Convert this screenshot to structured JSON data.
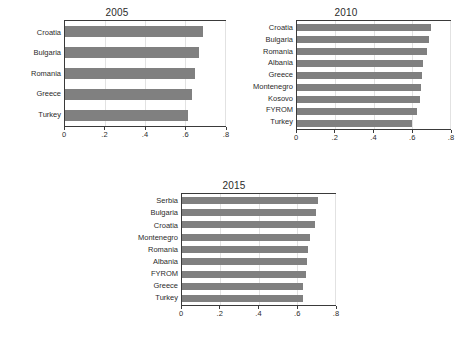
{
  "figure": {
    "background_color": "#ffffff",
    "bar_color": "#808080",
    "frame_color": "#3a3a3a",
    "gridline_color": "#e2e2e2"
  },
  "panels": [
    {
      "id": "panel-2005",
      "title": "2005"
    },
    {
      "id": "panel-2010",
      "title": "2010"
    },
    {
      "id": "panel-2015",
      "title": "2015"
    }
  ],
  "chart_data": [
    {
      "type": "bar",
      "orientation": "horizontal",
      "title": "2005",
      "xlabel": "",
      "ylabel": "",
      "xlim": [
        0,
        0.8
      ],
      "xticks": [
        0,
        0.2,
        0.4,
        0.6,
        0.8
      ],
      "xticklabels": [
        "0",
        ".2",
        ".4",
        ".6",
        ".8"
      ],
      "grid": true,
      "legend": "none",
      "categories": [
        "Croatia",
        "Bulgaria",
        "Romania",
        "Greece",
        "Turkey"
      ],
      "values": [
        0.69,
        0.67,
        0.65,
        0.635,
        0.615
      ]
    },
    {
      "type": "bar",
      "orientation": "horizontal",
      "title": "2010",
      "xlabel": "",
      "ylabel": "",
      "xlim": [
        0,
        0.8
      ],
      "xticks": [
        0,
        0.2,
        0.4,
        0.6,
        0.8
      ],
      "xticklabels": [
        "0",
        ".2",
        ".4",
        ".6",
        ".8"
      ],
      "grid": true,
      "legend": "none",
      "categories": [
        "Croatia",
        "Bulgaria",
        "Romania",
        "Albania",
        "Greece",
        "Montenegro",
        "Kosovo",
        "FYROM",
        "Turkey"
      ],
      "values": [
        0.7,
        0.69,
        0.68,
        0.66,
        0.655,
        0.65,
        0.645,
        0.625,
        0.6
      ]
    },
    {
      "type": "bar",
      "orientation": "horizontal",
      "title": "2015",
      "xlabel": "",
      "ylabel": "",
      "xlim": [
        0,
        0.8
      ],
      "xticks": [
        0,
        0.2,
        0.4,
        0.6,
        0.8
      ],
      "xticklabels": [
        "0",
        ".2",
        ".4",
        ".6",
        ".8"
      ],
      "grid": true,
      "legend": "none",
      "categories": [
        "Serbia",
        "Bulgaria",
        "Croatia",
        "Montenegro",
        "Romania",
        "Albania",
        "FYROM",
        "Greece",
        "Turkey"
      ],
      "values": [
        0.71,
        0.7,
        0.695,
        0.67,
        0.66,
        0.655,
        0.65,
        0.635,
        0.635
      ]
    }
  ]
}
